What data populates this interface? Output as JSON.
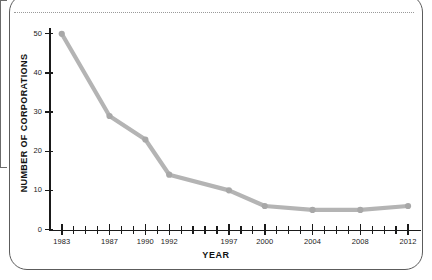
{
  "frame": {
    "has_rounded_border": true,
    "has_left_tab": true,
    "has_dotted_rule": true,
    "border_color": "#5c5c5c",
    "dotted_rule_color": "#9a9a9a"
  },
  "chart_data": {
    "type": "line",
    "title": "",
    "xlabel": "YEAR",
    "ylabel": "NUMBER OF CORPORATIONS",
    "x": [
      1983,
      1987,
      1990,
      1992,
      1997,
      2000,
      2004,
      2008,
      2012
    ],
    "values": [
      50,
      29,
      23,
      14,
      10,
      6,
      5,
      5,
      6
    ],
    "categories": [
      "1983",
      "1987",
      "1990",
      "1992",
      "1997",
      "2000",
      "2004",
      "2008",
      "2012"
    ],
    "xlim": [
      1982,
      2013
    ],
    "ylim": [
      0,
      52
    ],
    "ytick_labels": [
      "0",
      "10",
      "20",
      "30",
      "40",
      "50"
    ],
    "ytick_values": [
      0,
      10,
      20,
      30,
      40,
      50
    ],
    "xtick_minor_step": 1,
    "grid": false,
    "legend": null,
    "series_color": "#b4b4b4",
    "marker_color": "#a8a8a8",
    "marker_shape": "circle",
    "axis_color": "#1a1a1a"
  }
}
